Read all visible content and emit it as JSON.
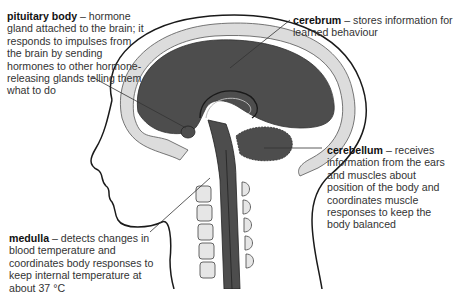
{
  "diagram": {
    "colors": {
      "brain": "#4d4d4d",
      "skull": "#dcdcdc",
      "outline": "#1a1a1a",
      "vertebra": "#e6e6e6",
      "background": "#ffffff"
    },
    "labels": [
      {
        "id": "pituitary",
        "term": "pituitary body",
        "description": "– hormone gland attached to the brain; it responds to impulses from the brain by sending hormones to other hormone-releasing glands telling them what to do"
      },
      {
        "id": "cerebrum",
        "term": "cerebrum",
        "description": "– stores information for learned behaviour"
      },
      {
        "id": "cerebellum",
        "term": "cerebellum",
        "description": "– receives information from the ears and muscles about position of the body and coordinates muscle responses to keep the body balanced"
      },
      {
        "id": "medulla",
        "term": "medulla",
        "description": "– detects changes in blood temperature and coordinates body responses to keep internal temperature at about 37 °C"
      }
    ]
  }
}
